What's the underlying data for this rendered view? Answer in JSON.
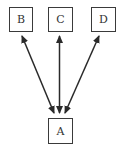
{
  "diagram": {
    "type": "directed-graph",
    "nodes": [
      {
        "id": "B",
        "label": "B",
        "x": 9,
        "y": 7,
        "w": 23,
        "h": 24
      },
      {
        "id": "C",
        "label": "C",
        "x": 48,
        "y": 7,
        "w": 24,
        "h": 24
      },
      {
        "id": "D",
        "label": "D",
        "x": 91,
        "y": 7,
        "w": 24,
        "h": 24
      },
      {
        "id": "A",
        "label": "A",
        "x": 48,
        "y": 118,
        "w": 24,
        "h": 25
      }
    ],
    "edges": [
      {
        "from": "A",
        "to": "B",
        "bidirectional": true
      },
      {
        "from": "A",
        "to": "C",
        "bidirectional": true
      },
      {
        "from": "A",
        "to": "D",
        "bidirectional": true
      }
    ]
  },
  "colors": {
    "stroke": "#2a2a2a",
    "box_border": "#3a3a3a",
    "text": "#333333",
    "background": "#ffffff"
  }
}
